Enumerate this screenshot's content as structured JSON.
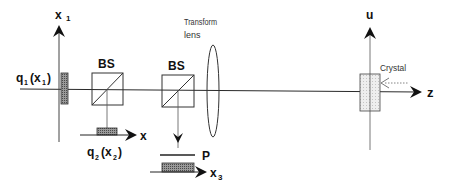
{
  "diagram": {
    "colors": {
      "line": "#2a2a2a",
      "light_line": "#555555",
      "detector_fill": "#7a7a7a",
      "crystal_fill": "#e4e4e4",
      "background": "#ffffff"
    },
    "labels": {
      "x1_axis": "x",
      "x1_axis_sub": "1",
      "q1": "q",
      "q1_sub": "1",
      "q1_arg": "(x",
      "q1_arg_sub": "1",
      "q1_close": ")",
      "bs1": "BS",
      "x_axis": "x",
      "q2": "q",
      "q2_sub": "2",
      "q2_arg": "(x",
      "q2_arg_sub": "2",
      "q2_close": ")",
      "bs2": "BS",
      "polarizer": "P",
      "x3_axis": "x",
      "x3_axis_sub": "3",
      "lens_line1": "Transform",
      "lens_line2": "lens",
      "u_axis": "u",
      "crystal": "Crystal",
      "z_axis": "z"
    },
    "components": [
      {
        "id": "detector-q1",
        "type": "detector",
        "label": "q1(x1)"
      },
      {
        "id": "beam-splitter-1",
        "type": "beam-splitter",
        "label": "BS"
      },
      {
        "id": "detector-q2",
        "type": "detector",
        "label": "q2(x2)"
      },
      {
        "id": "beam-splitter-2",
        "type": "beam-splitter",
        "label": "BS"
      },
      {
        "id": "polarizer",
        "type": "polarizer",
        "label": "P"
      },
      {
        "id": "detector-q3",
        "type": "detector",
        "label": "x3"
      },
      {
        "id": "transform-lens",
        "type": "lens",
        "label": "Transform lens"
      },
      {
        "id": "crystal",
        "type": "crystal",
        "label": "Crystal"
      }
    ]
  }
}
